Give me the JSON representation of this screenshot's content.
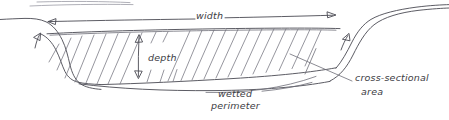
{
  "diagram": {
    "style": "hand-drawn pencil sketch",
    "ink_color": "#3c3c44",
    "background_color": "#ffffff",
    "labels": {
      "width": "width",
      "depth": "depth",
      "wetted_line1": "wetted",
      "wetted_line2": "perimeter",
      "cross_section_line1": "cross-sectional",
      "cross_section_line2": "area"
    },
    "annotations": {
      "width_arrow": "double-headed horizontal arrow spanning the channel top between the two banks",
      "depth_arrow": "double-headed vertical arrow from water surface down to channel bed",
      "wetted_perimeter_leader": "curved leader line pointing to the lower channel boundary",
      "cross_section_leader": "straight leader line from the hatched flow area to the label",
      "hatching": "diagonal pencil hatching filling the flow cross-section"
    }
  }
}
